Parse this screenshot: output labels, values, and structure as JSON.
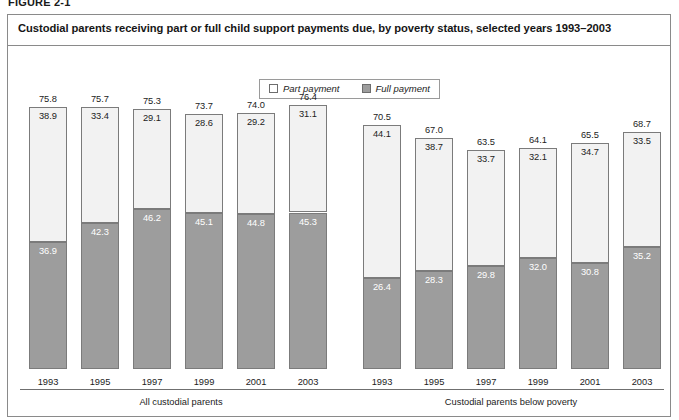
{
  "figure_tag": "FIGURE 2-1",
  "title": "Custodial parents receiving part or full child support payments due, by poverty status, selected years 1993–2003",
  "legend": {
    "items": [
      {
        "label": "Part payment",
        "swatch": "part-payment-swatch",
        "color": "#ffffff"
      },
      {
        "label": "Full payment",
        "swatch": "full-payment-swatch",
        "color": "#9d9d9d"
      }
    ]
  },
  "chart_data": {
    "type": "bar",
    "subtype": "stacked",
    "title": "Custodial parents receiving part or full child support payments due, by poverty status, selected years 1993–2003",
    "xlabel": "",
    "ylabel": "",
    "ylim": [
      0,
      80
    ],
    "grid": false,
    "legend_position": "top-center",
    "categories": [
      "1993",
      "1995",
      "1997",
      "1999",
      "2001",
      "2003"
    ],
    "groups": [
      {
        "name": "All custodial parents",
        "series": [
          {
            "name": "Full payment",
            "values": [
              36.9,
              42.3,
              46.2,
              45.1,
              44.8,
              45.3
            ]
          },
          {
            "name": "Part payment",
            "values": [
              38.9,
              33.4,
              29.1,
              28.6,
              29.2,
              31.1
            ]
          }
        ],
        "totals": [
          75.8,
          75.7,
          75.3,
          73.7,
          74.0,
          76.4
        ]
      },
      {
        "name": "Custodial parents below poverty",
        "series": [
          {
            "name": "Full payment",
            "values": [
              26.4,
              28.3,
              29.8,
              32.0,
              30.8,
              35.2
            ]
          },
          {
            "name": "Part payment",
            "values": [
              44.1,
              38.7,
              33.7,
              32.1,
              34.7,
              33.5
            ]
          }
        ],
        "totals": [
          70.5,
          67.0,
          63.5,
          64.1,
          65.5,
          68.7
        ]
      }
    ]
  }
}
